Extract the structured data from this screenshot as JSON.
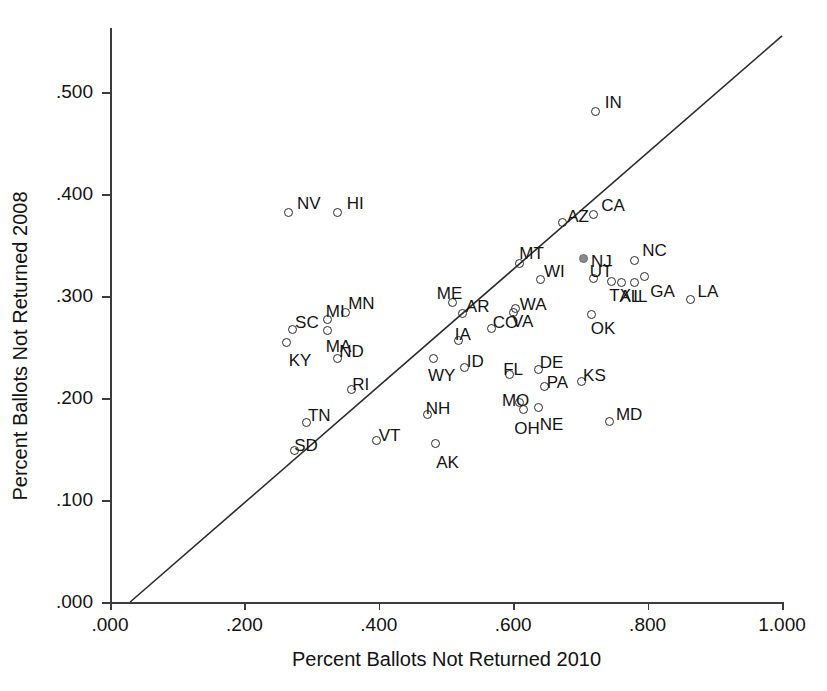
{
  "chart_data": {
    "type": "scatter",
    "title": "",
    "xlabel": "Percent Ballots Not Returned 2010",
    "ylabel": "Percent Ballots Not Returned 2008",
    "xlim": [
      0.0,
      1.0
    ],
    "ylim": [
      0.0,
      0.56
    ],
    "xticks": [
      ".000",
      ".200",
      ".400",
      ".600",
      ".800",
      "1.000"
    ],
    "xtick_values": [
      0.0,
      0.2,
      0.4,
      0.6,
      0.8,
      1.0
    ],
    "yticks": [
      ".000",
      ".100",
      ".200",
      ".300",
      ".400",
      ".500"
    ],
    "ytick_values": [
      0.0,
      0.1,
      0.2,
      0.3,
      0.4,
      0.5
    ],
    "grid": false,
    "legend": "none",
    "reference_line": {
      "name": "45-degree identity line",
      "x0": 0.03,
      "y0": 0.0,
      "x1": 1.0,
      "y1": 0.555
    },
    "point_style": "open circle marker with state abbreviation label",
    "points": [
      {
        "label": "NV",
        "x": 0.265,
        "y": 0.382,
        "label_dx": 9,
        "label_dy": -17,
        "filled": false
      },
      {
        "label": "HI",
        "x": 0.339,
        "y": 0.382,
        "label_dx": 9,
        "label_dy": -17,
        "filled": false
      },
      {
        "label": "IN",
        "x": 0.723,
        "y": 0.481,
        "label_dx": 9,
        "label_dy": -17,
        "filled": false
      },
      {
        "label": "AZ",
        "x": 0.673,
        "y": 0.372,
        "label_dx": 5,
        "label_dy": -15,
        "filled": false
      },
      {
        "label": "CA",
        "x": 0.719,
        "y": 0.38,
        "label_dx": 8,
        "label_dy": -17,
        "filled": false
      },
      {
        "label": "MT",
        "x": 0.609,
        "y": 0.332,
        "label_dx": 0,
        "label_dy": -18,
        "filled": false
      },
      {
        "label": "NC",
        "x": 0.78,
        "y": 0.335,
        "label_dx": 8,
        "label_dy": -18,
        "filled": false
      },
      {
        "label": "NJ",
        "x": 0.704,
        "y": 0.337,
        "label_dx": 8,
        "label_dy": -5,
        "filled": true
      },
      {
        "label": "WI",
        "x": 0.64,
        "y": 0.316,
        "label_dx": 4,
        "label_dy": -17,
        "filled": false
      },
      {
        "label": "UT",
        "x": 0.72,
        "y": 0.317,
        "label_dx": -4,
        "label_dy": -16,
        "filled": false
      },
      {
        "label": "TX",
        "x": 0.746,
        "y": 0.314,
        "label_dx": -2,
        "label_dy": 5,
        "filled": false
      },
      {
        "label": "AL",
        "x": 0.761,
        "y": 0.313,
        "label_dx": -2,
        "label_dy": 5,
        "filled": false
      },
      {
        "label": "IL",
        "x": 0.78,
        "y": 0.313,
        "label_dx": -1,
        "label_dy": 5,
        "filled": false
      },
      {
        "label": "GA",
        "x": 0.795,
        "y": 0.319,
        "label_dx": 6,
        "label_dy": 6,
        "filled": false
      },
      {
        "label": "LA",
        "x": 0.864,
        "y": 0.297,
        "label_dx": 7,
        "label_dy": -16,
        "filled": false
      },
      {
        "label": "VA",
        "x": 0.604,
        "y": 0.288,
        "label_dx": -4,
        "label_dy": 5,
        "filled": false
      },
      {
        "label": "ME",
        "x": 0.51,
        "y": 0.294,
        "label_dx": -16,
        "label_dy": -17,
        "filled": false
      },
      {
        "label": "AR",
        "x": 0.525,
        "y": 0.283,
        "label_dx": 3,
        "label_dy": -15,
        "filled": false
      },
      {
        "label": "MN",
        "x": 0.35,
        "y": 0.284,
        "label_dx": 3,
        "label_dy": -17,
        "filled": false
      },
      {
        "label": "MI",
        "x": 0.324,
        "y": 0.277,
        "label_dx": -2,
        "label_dy": -16,
        "filled": false
      },
      {
        "label": "SC",
        "x": 0.271,
        "y": 0.267,
        "label_dx": 3,
        "label_dy": -16,
        "filled": false
      },
      {
        "label": "MA",
        "x": 0.324,
        "y": 0.266,
        "label_dx": -2,
        "label_dy": 7,
        "filled": false
      },
      {
        "label": "KY",
        "x": 0.263,
        "y": 0.254,
        "label_dx": 2,
        "label_dy": 9,
        "filled": false
      },
      {
        "label": "ND",
        "x": 0.338,
        "y": 0.239,
        "label_dx": 2,
        "label_dy": -15,
        "filled": false
      },
      {
        "label": "OK",
        "x": 0.717,
        "y": 0.282,
        "label_dx": -1,
        "label_dy": 6,
        "filled": false
      },
      {
        "label": "WA",
        "x": 0.601,
        "y": 0.284,
        "label_dx": 6,
        "label_dy": -16,
        "filled": false
      },
      {
        "label": "IA",
        "x": 0.519,
        "y": 0.256,
        "label_dx": -4,
        "label_dy": -15,
        "filled": false
      },
      {
        "label": "CO",
        "x": 0.568,
        "y": 0.268,
        "label_dx": 1,
        "label_dy": -15,
        "filled": false
      },
      {
        "label": "ID",
        "x": 0.528,
        "y": 0.23,
        "label_dx": 2,
        "label_dy": -14,
        "filled": false
      },
      {
        "label": "DE",
        "x": 0.638,
        "y": 0.228,
        "label_dx": 1,
        "label_dy": -15,
        "filled": false
      },
      {
        "label": "FL",
        "x": 0.594,
        "y": 0.223,
        "label_dx": -6,
        "label_dy": -14,
        "filled": false
      },
      {
        "label": "PA",
        "x": 0.647,
        "y": 0.211,
        "label_dx": 2,
        "label_dy": -13,
        "filled": false
      },
      {
        "label": "KS",
        "x": 0.701,
        "y": 0.216,
        "label_dx": 2,
        "label_dy": -15,
        "filled": false
      },
      {
        "label": "WY",
        "x": 0.482,
        "y": 0.239,
        "label_dx": -6,
        "label_dy": 9,
        "filled": false
      },
      {
        "label": "RI",
        "x": 0.359,
        "y": 0.208,
        "label_dx": 1,
        "label_dy": -14,
        "filled": false
      },
      {
        "label": "MO",
        "x": 0.61,
        "y": 0.196,
        "label_dx": -18,
        "label_dy": -10,
        "filled": false
      },
      {
        "label": "NE",
        "x": 0.638,
        "y": 0.191,
        "label_dx": 1,
        "label_dy": 9,
        "filled": false
      },
      {
        "label": "OH",
        "x": 0.615,
        "y": 0.189,
        "label_dx": -9,
        "label_dy": 11,
        "filled": false
      },
      {
        "label": "MD",
        "x": 0.744,
        "y": 0.177,
        "label_dx": 6,
        "label_dy": -15,
        "filled": false
      },
      {
        "label": "TN",
        "x": 0.293,
        "y": 0.176,
        "label_dx": 1,
        "label_dy": -15,
        "filled": false
      },
      {
        "label": "SD",
        "x": 0.274,
        "y": 0.149,
        "label_dx": 0,
        "label_dy": -13,
        "filled": false
      },
      {
        "label": "NH",
        "x": 0.473,
        "y": 0.184,
        "label_dx": -2,
        "label_dy": -14,
        "filled": false
      },
      {
        "label": "AK",
        "x": 0.484,
        "y": 0.155,
        "label_dx": 1,
        "label_dy": 10,
        "filled": false
      },
      {
        "label": "VT",
        "x": 0.397,
        "y": 0.158,
        "label_dx": 2,
        "label_dy": -14,
        "filled": false
      }
    ]
  }
}
